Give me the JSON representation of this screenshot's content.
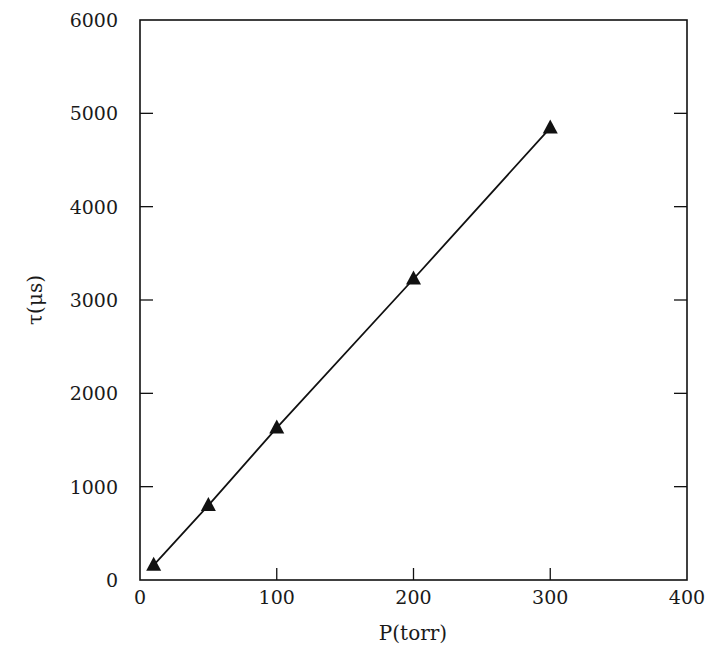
{
  "chart_data": {
    "type": "line",
    "title": "",
    "xlabel": "P(torr)",
    "ylabel": "τ(μs)",
    "xlim": [
      0,
      400
    ],
    "ylim": [
      0,
      6000
    ],
    "x_ticks": [
      0,
      100,
      200,
      300,
      400
    ],
    "y_ticks": [
      0,
      1000,
      2000,
      3000,
      4000,
      5000,
      6000
    ],
    "grid": false,
    "legend": null,
    "series": [
      {
        "name": "tau vs pressure",
        "marker": "filled-triangle",
        "line": "solid",
        "color": "#111111",
        "x": [
          10,
          50,
          100,
          200,
          300
        ],
        "y": [
          160,
          800,
          1630,
          3225,
          4845
        ]
      }
    ]
  },
  "colors": {
    "ink": "#111111",
    "background": "#ffffff"
  }
}
